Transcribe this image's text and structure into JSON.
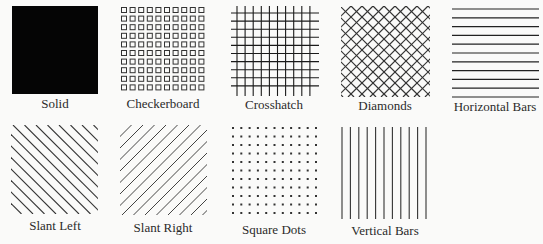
{
  "colors": {
    "background": "#fafaf9",
    "ink": "#1a1a1a",
    "label": "#2a2a2a"
  },
  "patterns": [
    {
      "id": "solid",
      "label": "Solid",
      "icon": "solid-fill-icon"
    },
    {
      "id": "checkerboard",
      "label": "Checkerboard",
      "icon": "checkerboard-pattern-icon"
    },
    {
      "id": "crosshatch",
      "label": "Crosshatch",
      "icon": "crosshatch-pattern-icon"
    },
    {
      "id": "diamonds",
      "label": "Diamonds",
      "icon": "diamonds-pattern-icon"
    },
    {
      "id": "horizontal-bars",
      "label": "Horizontal Bars",
      "icon": "horizontal-bars-pattern-icon"
    },
    {
      "id": "slant-left",
      "label": "Slant Left",
      "icon": "slant-left-pattern-icon"
    },
    {
      "id": "slant-right",
      "label": "Slant Right",
      "icon": "slant-right-pattern-icon"
    },
    {
      "id": "square-dots",
      "label": "Square Dots",
      "icon": "square-dots-pattern-icon"
    },
    {
      "id": "vertical-bars",
      "label": "Vertical Bars",
      "icon": "vertical-bars-pattern-icon"
    }
  ]
}
